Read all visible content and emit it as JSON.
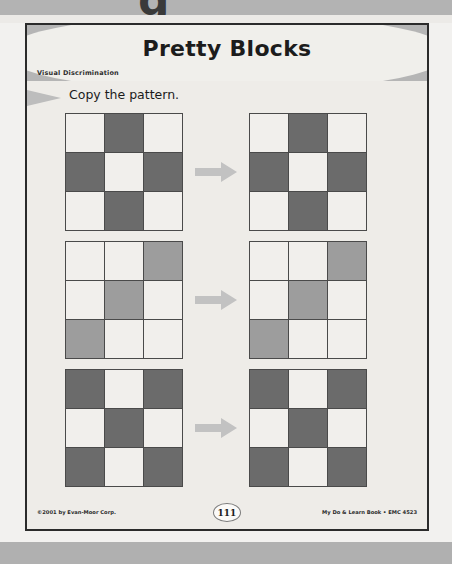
{
  "document": {
    "title": "Pretty Blocks",
    "subtitle": "Visual Discrimination",
    "instruction": "Copy the pattern.",
    "partial_glyph": "g"
  },
  "icons": {
    "instruction_wedge": "triangle-right-icon",
    "row_arrow": "arrow-right-icon"
  },
  "colors": {
    "page_background": "#eeece8",
    "banner_band": "#b5b5b5",
    "banner_lens": "#f0efeb",
    "cell_white": "#f1efec",
    "cell_dark": "#6b6b6b",
    "cell_gray": "#9d9d9d",
    "grid_line": "#4a4a4a",
    "arrow": "#c2c2c2",
    "scan_strip": "#b3b3b3",
    "text": "#1c1c1c"
  },
  "exercises": [
    {
      "id": "exercise-1",
      "model_label": "pattern-model-1",
      "copy_label": "pattern-copy-1",
      "rows": 3,
      "cols": 3,
      "model": [
        [
          "white",
          "dark",
          "white"
        ],
        [
          "dark",
          "white",
          "dark"
        ],
        [
          "white",
          "dark",
          "white"
        ]
      ],
      "copy": [
        [
          "white",
          "dark",
          "white"
        ],
        [
          "dark",
          "white",
          "dark"
        ],
        [
          "white",
          "dark",
          "white"
        ]
      ]
    },
    {
      "id": "exercise-2",
      "model_label": "pattern-model-2",
      "copy_label": "pattern-copy-2",
      "rows": 3,
      "cols": 3,
      "model": [
        [
          "white",
          "white",
          "gray"
        ],
        [
          "white",
          "gray",
          "white"
        ],
        [
          "gray",
          "white",
          "white"
        ]
      ],
      "copy": [
        [
          "white",
          "white",
          "gray"
        ],
        [
          "white",
          "gray",
          "white"
        ],
        [
          "gray",
          "white",
          "white"
        ]
      ]
    },
    {
      "id": "exercise-3",
      "model_label": "pattern-model-3",
      "copy_label": "pattern-copy-3",
      "rows": 3,
      "cols": 3,
      "model": [
        [
          "dark",
          "white",
          "dark"
        ],
        [
          "white",
          "dark",
          "white"
        ],
        [
          "dark",
          "white",
          "dark"
        ]
      ],
      "copy": [
        [
          "dark",
          "white",
          "dark"
        ],
        [
          "white",
          "dark",
          "white"
        ],
        [
          "dark",
          "white",
          "dark"
        ]
      ]
    }
  ],
  "footer": {
    "copyright": "©2001 by Evan-Moor Corp.",
    "page_number": "111",
    "source": "My Do & Learn Book • EMC 4523"
  }
}
